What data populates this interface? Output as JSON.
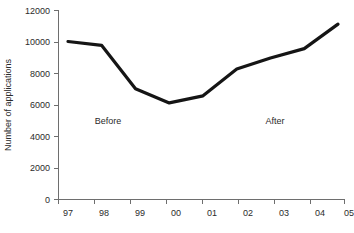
{
  "chart_data": {
    "type": "line",
    "title": "",
    "xlabel": "",
    "ylabel": "Number of applications",
    "categories": [
      "97",
      "98",
      "99",
      "00",
      "01",
      "02",
      "03",
      "04",
      "05"
    ],
    "values": [
      10000,
      9750,
      7000,
      6100,
      6550,
      8250,
      8950,
      9550,
      11100
    ],
    "series": [
      {
        "name": "Number of applications",
        "values": [
          10000,
          9750,
          7000,
          6100,
          6550,
          8250,
          8950,
          9550,
          11100
        ]
      }
    ],
    "ylim": [
      0,
      12000
    ],
    "ytick_labels": [
      "0",
      "2000",
      "4000",
      "6000",
      "8000",
      "10000",
      "12000"
    ],
    "ytick_values": [
      0,
      2000,
      4000,
      6000,
      8000,
      10000,
      12000
    ],
    "xtick_labels": [
      "97",
      "98",
      "99",
      "00",
      "01",
      "02",
      "03",
      "04",
      "05"
    ],
    "grid": false,
    "legend": "none",
    "line_color": "#151515",
    "axis_color": "#6e6e6e",
    "background_color": "#ffffff",
    "annotations": [
      {
        "text": "Before",
        "x_value": "98",
        "y_value": 4800
      },
      {
        "text": "After",
        "x_value": "03",
        "y_value": 4800
      }
    ]
  }
}
